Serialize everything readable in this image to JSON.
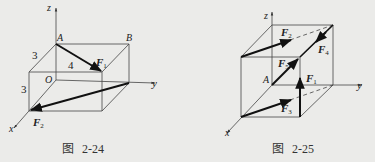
{
  "figures": [
    {
      "caption_prefix": "图",
      "caption_number": "2-24",
      "axes": {
        "x": "x",
        "y": "y",
        "z": "z"
      },
      "points": {
        "origin": "O",
        "a": "A",
        "b": "B"
      },
      "dimensions": {
        "depth": "3",
        "width": "4",
        "height": "3"
      },
      "forces": {
        "f1": "F",
        "f1_sub": "1",
        "f2": "F",
        "f2_sub": "2"
      }
    },
    {
      "caption_prefix": "图",
      "caption_number": "2-25",
      "axes": {
        "x": "x",
        "y": "y",
        "z": "z"
      },
      "points": {
        "a": "A"
      },
      "forces": {
        "f1": "F",
        "f1_sub": "1",
        "f2": "F",
        "f2_sub": "2",
        "f3": "F",
        "f3_sub": "3",
        "f4": "F",
        "f4_sub": "4",
        "f5": "F",
        "f5_sub": "5"
      }
    }
  ],
  "colors": {
    "line": "#333333",
    "force": "#111111",
    "background": "#ebebe9"
  }
}
